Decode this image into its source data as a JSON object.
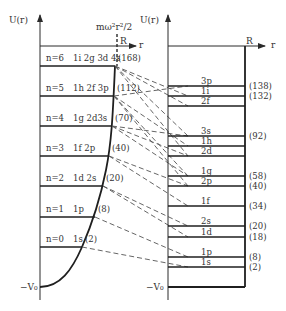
{
  "left_panel": {
    "y_axis_label": "U(r)",
    "x_axis_label": "r",
    "radius_label": "R",
    "potential_label": "mω²r²/2",
    "bottom_label": "−V₀",
    "levels": [
      {
        "n": "n=6",
        "orbitals": "1i 2g 3d 4s",
        "magic": "(168)",
        "y": 66,
        "xend": 115
      },
      {
        "n": "n=5",
        "orbitals": "1h 2f 3p",
        "magic": "(112)",
        "y": 96,
        "xend": 114
      },
      {
        "n": "n=4",
        "orbitals": "1g 2d3s",
        "magic": "(70)",
        "y": 126,
        "xend": 112
      },
      {
        "n": "n=3",
        "orbitals": "1f 2p",
        "magic": "(40)",
        "y": 156,
        "xend": 109
      },
      {
        "n": "n=2",
        "orbitals": "1d 2s",
        "magic": "(20)",
        "y": 186,
        "xend": 103
      },
      {
        "n": "n=1",
        "orbitals": "1p",
        "magic": "(8)",
        "y": 217,
        "xend": 95
      },
      {
        "n": "n=0",
        "orbitals": "1s",
        "magic": "(2)",
        "y": 247,
        "xend": 82
      }
    ]
  },
  "right_panel": {
    "y_axis_label": "U(r)",
    "x_axis_label": "r",
    "radius_label": "R",
    "bottom_label": "−V₀",
    "levels": [
      {
        "orbital": "3p",
        "y": 86,
        "magic": "(138)"
      },
      {
        "orbital": "1i",
        "y": 96,
        "magic": "(132)"
      },
      {
        "orbital": "2f",
        "y": 106,
        "magic": ""
      },
      {
        "orbital": "3s",
        "y": 136,
        "magic": "(92)"
      },
      {
        "orbital": "1h",
        "y": 146,
        "magic": ""
      },
      {
        "orbital": "2d",
        "y": 156,
        "magic": ""
      },
      {
        "orbital": "1g",
        "y": 176,
        "magic": "(58)"
      },
      {
        "orbital": "2p",
        "y": 186,
        "magic": "(40)"
      },
      {
        "orbital": "1f",
        "y": 206,
        "magic": "(34)"
      },
      {
        "orbital": "2s",
        "y": 226,
        "magic": "(20)"
      },
      {
        "orbital": "1d",
        "y": 237,
        "magic": "(18)"
      },
      {
        "orbital": "1p",
        "y": 257,
        "magic": "(8)"
      },
      {
        "orbital": "1s",
        "y": 267,
        "magic": "(2)"
      }
    ]
  },
  "colors": {
    "line": "#2a2a2a",
    "text": "#333333",
    "dash": "#555555"
  }
}
